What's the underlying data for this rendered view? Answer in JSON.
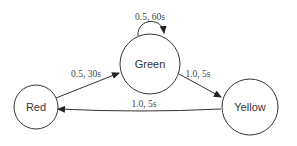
{
  "diagram": {
    "type": "state-machine",
    "colors": {
      "stroke": "#333333",
      "fill": "#ffffff",
      "text": "#333333"
    },
    "states": [
      {
        "id": "red",
        "label": "Red"
      },
      {
        "id": "green",
        "label": "Green"
      },
      {
        "id": "yellow",
        "label": "Yellow"
      }
    ],
    "transitions": [
      {
        "from": "green",
        "to": "green",
        "label": "0.5, 60s"
      },
      {
        "from": "red",
        "to": "green",
        "label": "0.5, 30s"
      },
      {
        "from": "green",
        "to": "yellow",
        "label": "1.0, 5s"
      },
      {
        "from": "yellow",
        "to": "red",
        "label": "1.0, 5s"
      }
    ]
  }
}
